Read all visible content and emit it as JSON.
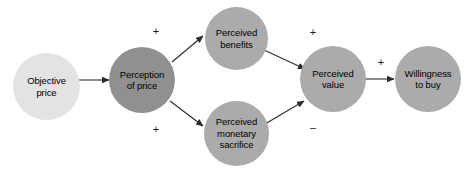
{
  "diagram": {
    "background": "#ffffff",
    "colors": {
      "node_light": "#e3e3e3",
      "node_medium": "#ababab",
      "node_dark": "#909090",
      "edge": "#2b2b2b",
      "text": "#000000"
    },
    "nodes": [
      {
        "id": "objective-price",
        "label": "Objective\nprice",
        "cx": 46,
        "cy": 86,
        "d": 67,
        "fill": "#e3e3e3"
      },
      {
        "id": "perception-of-price",
        "label": "Perception\nof price",
        "cx": 142,
        "cy": 80,
        "d": 66,
        "fill": "#909090"
      },
      {
        "id": "perceived-benefits",
        "label": "Perceived\nbenefits",
        "cx": 236,
        "cy": 38,
        "d": 63,
        "fill": "#ababab"
      },
      {
        "id": "perceived-monetary-sacrifice",
        "label": "Perceived\nmonetary\nsacrifice",
        "cx": 236,
        "cy": 133,
        "d": 65,
        "fill": "#ababab"
      },
      {
        "id": "perceived-value",
        "label": "Perceived\nvalue",
        "cx": 333,
        "cy": 79,
        "d": 66,
        "fill": "#ababab"
      },
      {
        "id": "willingness-to-buy",
        "label": "Willingness\nto buy",
        "cx": 428,
        "cy": 79,
        "d": 66,
        "fill": "#ababab"
      }
    ],
    "edges": [
      {
        "id": "objective-price-to-perception-of-price",
        "from": "objective-price",
        "to": "perception-of-price",
        "sign": ""
      },
      {
        "id": "perception-of-price-to-perceived-benefits",
        "from": "perception-of-price",
        "to": "perceived-benefits",
        "sign": "+"
      },
      {
        "id": "perception-of-price-to-perceived-monetary-sacrifice",
        "from": "perception-of-price",
        "to": "perceived-monetary-sacrifice",
        "sign": "+"
      },
      {
        "id": "perceived-benefits-to-perceived-value",
        "from": "perceived-benefits",
        "to": "perceived-value",
        "sign": "+"
      },
      {
        "id": "perceived-monetary-sacrifice-to-perceived-value",
        "from": "perceived-monetary-sacrifice",
        "to": "perceived-value",
        "sign": "–"
      },
      {
        "id": "perceived-value-to-willingness-to-buy",
        "from": "perceived-value",
        "to": "willingness-to-buy",
        "sign": "+"
      }
    ],
    "signs": [
      {
        "id": "sign-price-to-benefits",
        "text": "+",
        "x": 149,
        "y": 26
      },
      {
        "id": "sign-price-to-sacrifice",
        "text": "+",
        "x": 149,
        "y": 124
      },
      {
        "id": "sign-benefits-to-value",
        "text": "+",
        "x": 306,
        "y": 27
      },
      {
        "id": "sign-sacrifice-to-value",
        "text": "–",
        "x": 306,
        "y": 122
      },
      {
        "id": "sign-value-to-willingness",
        "text": "+",
        "x": 374,
        "y": 57
      }
    ]
  }
}
